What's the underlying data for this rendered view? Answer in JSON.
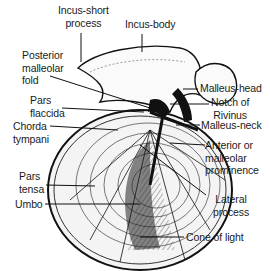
{
  "diagram": {
    "labels": {
      "incus_short_process": "Incus-short\nprocess",
      "incus_body": "Incus-body",
      "posterior_malleolar_fold": "Posterior\nmalleolar\nfold",
      "pars_flaccida": "Pars\nflaccida",
      "chorda_tympani": "Chorda\ntympani",
      "pars_tensa": "Pars\ntensa",
      "umbo": "Umbo",
      "malleus_head": "Malleus-head",
      "notch_of_rivinus": "Notch of\nRivinus",
      "malleus_neck": "Malleus-neck",
      "anterior_malleolar_prominence": "Anterior or\nmalleolar\nprominence",
      "lateral_process": "Lateral\nprocess",
      "cone_of_light": "Cone of light"
    },
    "colors": {
      "ink": "#111111",
      "background": "#ffffff"
    }
  }
}
